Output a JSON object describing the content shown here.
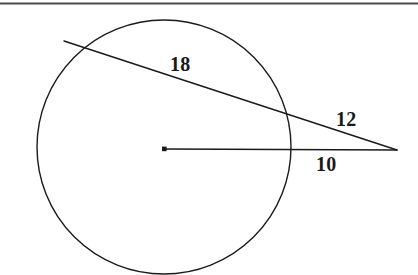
{
  "figure": {
    "kind": "geometry-diagram",
    "width": 418,
    "height": 275,
    "background_color": "#ffffff",
    "stroke_color": "#1a1a1a",
    "top_rule_color": "#4a4a4a"
  },
  "circle": {
    "center_x": 164,
    "center_y": 147,
    "radius": 127,
    "stroke_width": 1.4,
    "fill": "none"
  },
  "center_point": {
    "x": 164,
    "y": 149,
    "size": 4
  },
  "segments": [
    {
      "name": "secant-line",
      "x1": 64,
      "y1": 41,
      "x2": 397,
      "y2": 150,
      "stroke_width": 1.4
    },
    {
      "name": "radius-to-external-point",
      "x1": 164,
      "y1": 149,
      "x2": 397,
      "y2": 150,
      "stroke_width": 1.4
    }
  ],
  "labels": {
    "secant_chord": "18",
    "secant_external": "12",
    "radius_external": "10"
  }
}
